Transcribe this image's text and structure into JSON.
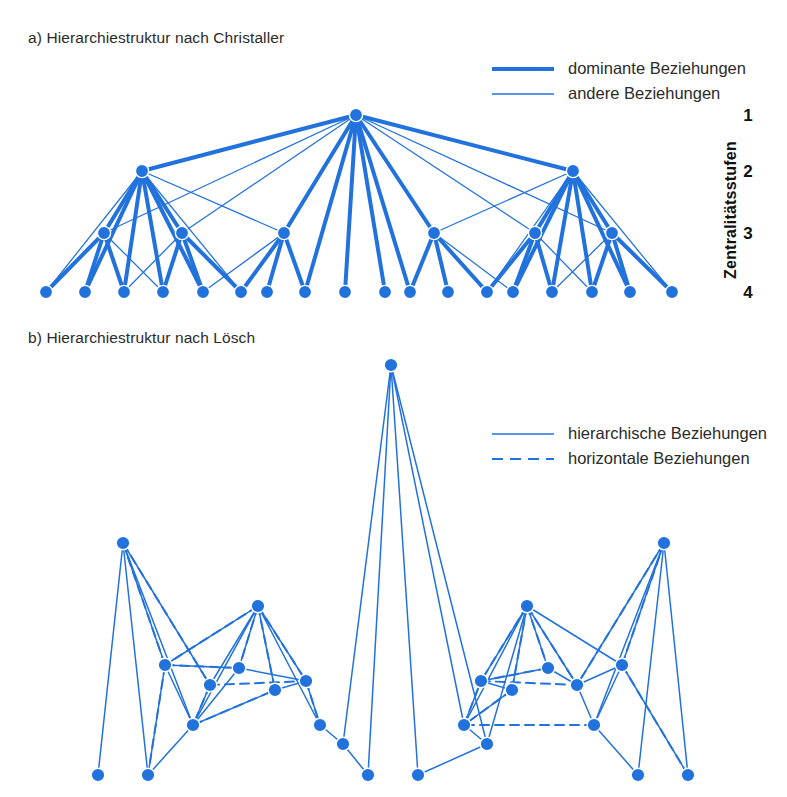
{
  "figure": {
    "accent_color": "#2272dd",
    "text_color": "#2b2b2b",
    "background": "#ffffff"
  },
  "panel_a": {
    "title": "a) Hierarchiestruktur nach Christaller",
    "legend": [
      {
        "label": "dominante Beziehungen",
        "style": "thick-solid",
        "icon": "thick-line-icon"
      },
      {
        "label": "andere Beziehungen",
        "style": "thin-solid",
        "icon": "thin-line-icon"
      }
    ],
    "axis": {
      "label": "Zentralitätsstufen",
      "levels": [
        "1",
        "2",
        "3",
        "4"
      ]
    }
  },
  "panel_b": {
    "title": "b) Hierarchiestruktur nach Lösch",
    "legend": [
      {
        "label": "hierarchische Beziehungen",
        "style": "solid",
        "icon": "solid-line-icon"
      },
      {
        "label": "horizontale Beziehungen",
        "style": "dashed",
        "icon": "dashed-line-icon"
      }
    ]
  },
  "chart_data": {
    "type": "diagram",
    "panels": [
      {
        "id": "a",
        "title": "a) Hierarchiestruktur nach Christaller",
        "type": "hierarchy-tree",
        "levels": [
          {
            "level": 1,
            "y": 115,
            "label": "1"
          },
          {
            "level": 2,
            "y": 171,
            "label": "2"
          },
          {
            "level": 3,
            "y": 233,
            "label": "3"
          },
          {
            "level": 4,
            "y": 292,
            "label": "4"
          }
        ],
        "nodes": [
          {
            "id": "r",
            "level": 1,
            "x": 356,
            "y": 115
          },
          {
            "id": "l2a",
            "level": 2,
            "x": 142,
            "y": 171
          },
          {
            "id": "l2b",
            "level": 2,
            "x": 573,
            "y": 171
          },
          {
            "id": "l3a",
            "level": 3,
            "x": 104,
            "y": 233
          },
          {
            "id": "l3b",
            "level": 3,
            "x": 182,
            "y": 233
          },
          {
            "id": "l3c",
            "level": 3,
            "x": 284,
            "y": 233
          },
          {
            "id": "l3d",
            "level": 3,
            "x": 434,
            "y": 233
          },
          {
            "id": "l3e",
            "level": 3,
            "x": 535,
            "y": 233
          },
          {
            "id": "l3f",
            "level": 3,
            "x": 612,
            "y": 233
          },
          {
            "id": "b1",
            "level": 4,
            "x": 46,
            "y": 292
          },
          {
            "id": "b2",
            "level": 4,
            "x": 85,
            "y": 292
          },
          {
            "id": "b3",
            "level": 4,
            "x": 124,
            "y": 292
          },
          {
            "id": "b4",
            "level": 4,
            "x": 163,
            "y": 292
          },
          {
            "id": "b5",
            "level": 4,
            "x": 203,
            "y": 292
          },
          {
            "id": "b6",
            "level": 4,
            "x": 241,
            "y": 292
          },
          {
            "id": "b7",
            "level": 4,
            "x": 267,
            "y": 292
          },
          {
            "id": "b8",
            "level": 4,
            "x": 305,
            "y": 292
          },
          {
            "id": "b9",
            "level": 4,
            "x": 345,
            "y": 292
          },
          {
            "id": "b10",
            "level": 4,
            "x": 385,
            "y": 292
          },
          {
            "id": "b11",
            "level": 4,
            "x": 410,
            "y": 292
          },
          {
            "id": "b12",
            "level": 4,
            "x": 448,
            "y": 292
          },
          {
            "id": "b13",
            "level": 4,
            "x": 487,
            "y": 292
          },
          {
            "id": "b14",
            "level": 4,
            "x": 513,
            "y": 292
          },
          {
            "id": "b15",
            "level": 4,
            "x": 552,
            "y": 292
          },
          {
            "id": "b16",
            "level": 4,
            "x": 592,
            "y": 292
          },
          {
            "id": "b17",
            "level": 4,
            "x": 630,
            "y": 292
          },
          {
            "id": "b18",
            "level": 4,
            "x": 672,
            "y": 292
          }
        ],
        "edges_dominant": [
          [
            "r",
            "l2a"
          ],
          [
            "r",
            "l2b"
          ],
          [
            "r",
            "l3c"
          ],
          [
            "r",
            "l3d"
          ],
          [
            "r",
            "b8"
          ],
          [
            "r",
            "b9"
          ],
          [
            "r",
            "b10"
          ],
          [
            "r",
            "b11"
          ],
          [
            "l2a",
            "l3a"
          ],
          [
            "l2a",
            "l3b"
          ],
          [
            "l2a",
            "b2"
          ],
          [
            "l2a",
            "b3"
          ],
          [
            "l2a",
            "b4"
          ],
          [
            "l2a",
            "b5"
          ],
          [
            "l2b",
            "l3e"
          ],
          [
            "l2b",
            "l3f"
          ],
          [
            "l2b",
            "b14"
          ],
          [
            "l2b",
            "b15"
          ],
          [
            "l2b",
            "b16"
          ],
          [
            "l2b",
            "b17"
          ],
          [
            "l3a",
            "b1"
          ],
          [
            "l3a",
            "b2"
          ],
          [
            "l3a",
            "b3"
          ],
          [
            "l3b",
            "b4"
          ],
          [
            "l3b",
            "b5"
          ],
          [
            "l3b",
            "b6"
          ],
          [
            "l3c",
            "b6"
          ],
          [
            "l3c",
            "b7"
          ],
          [
            "l3c",
            "b8"
          ],
          [
            "l3d",
            "b11"
          ],
          [
            "l3d",
            "b12"
          ],
          [
            "l3d",
            "b13"
          ],
          [
            "l3e",
            "b13"
          ],
          [
            "l3e",
            "b14"
          ],
          [
            "l3e",
            "b15"
          ],
          [
            "l3f",
            "b16"
          ],
          [
            "l3f",
            "b17"
          ],
          [
            "l3f",
            "b18"
          ]
        ],
        "edges_other": [
          [
            "r",
            "l3a"
          ],
          [
            "r",
            "l3b"
          ],
          [
            "r",
            "l3e"
          ],
          [
            "r",
            "l3f"
          ],
          [
            "l2a",
            "l3c"
          ],
          [
            "l2a",
            "b1"
          ],
          [
            "l2a",
            "b6"
          ],
          [
            "l2b",
            "l3d"
          ],
          [
            "l2b",
            "b13"
          ],
          [
            "l2b",
            "b18"
          ],
          [
            "l3a",
            "b4"
          ],
          [
            "l3b",
            "b3"
          ],
          [
            "l3c",
            "b5"
          ],
          [
            "l3d",
            "b14"
          ],
          [
            "l3e",
            "b16"
          ],
          [
            "l3f",
            "b15"
          ]
        ]
      },
      {
        "id": "b",
        "title": "b) Hierarchiestruktur nach Lösch",
        "type": "network",
        "nodes": [
          {
            "id": "p0",
            "x": 391,
            "y": 28
          },
          {
            "id": "pL",
            "x": 123,
            "y": 206
          },
          {
            "id": "pR",
            "x": 664,
            "y": 206
          },
          {
            "id": "mL",
            "x": 258,
            "y": 269
          },
          {
            "id": "mR",
            "x": 527,
            "y": 269
          },
          {
            "id": "n1",
            "x": 165,
            "y": 328
          },
          {
            "id": "n2",
            "x": 210,
            "y": 348
          },
          {
            "id": "n3",
            "x": 193,
            "y": 388
          },
          {
            "id": "n4",
            "x": 239,
            "y": 331
          },
          {
            "id": "n5",
            "x": 275,
            "y": 353
          },
          {
            "id": "n6",
            "x": 306,
            "y": 344
          },
          {
            "id": "n7",
            "x": 320,
            "y": 388
          },
          {
            "id": "n8",
            "x": 343,
            "y": 407
          },
          {
            "id": "m1",
            "x": 464,
            "y": 388
          },
          {
            "id": "m2",
            "x": 487,
            "y": 407
          },
          {
            "id": "m3",
            "x": 481,
            "y": 344
          },
          {
            "id": "m4",
            "x": 512,
            "y": 353
          },
          {
            "id": "m5",
            "x": 548,
            "y": 331
          },
          {
            "id": "m6",
            "x": 594,
            "y": 388
          },
          {
            "id": "m7",
            "x": 577,
            "y": 348
          },
          {
            "id": "m8",
            "x": 622,
            "y": 328
          },
          {
            "id": "g1",
            "x": 98,
            "y": 438
          },
          {
            "id": "g2",
            "x": 148,
            "y": 438
          },
          {
            "id": "g3",
            "x": 368,
            "y": 438
          },
          {
            "id": "g4",
            "x": 418,
            "y": 438
          },
          {
            "id": "g5",
            "x": 638,
            "y": 438
          },
          {
            "id": "g6",
            "x": 688,
            "y": 438
          }
        ],
        "edges_hierarchical": [
          [
            "p0",
            "g3"
          ],
          [
            "p0",
            "g4"
          ],
          [
            "p0",
            "n8"
          ],
          [
            "p0",
            "m1"
          ],
          [
            "p0",
            "m2"
          ],
          [
            "pL",
            "g1"
          ],
          [
            "pL",
            "g2"
          ],
          [
            "pL",
            "n3"
          ],
          [
            "pL",
            "n1"
          ],
          [
            "pL",
            "n2"
          ],
          [
            "pR",
            "g5"
          ],
          [
            "pR",
            "g6"
          ],
          [
            "pR",
            "m6"
          ],
          [
            "pR",
            "m8"
          ],
          [
            "pR",
            "m7"
          ],
          [
            "mL",
            "n1"
          ],
          [
            "mL",
            "n2"
          ],
          [
            "mL",
            "n3"
          ],
          [
            "mL",
            "n4"
          ],
          [
            "mL",
            "n5"
          ],
          [
            "mL",
            "n6"
          ],
          [
            "mL",
            "n7"
          ],
          [
            "mR",
            "m3"
          ],
          [
            "mR",
            "m4"
          ],
          [
            "mR",
            "m5"
          ],
          [
            "mR",
            "m1"
          ],
          [
            "mR",
            "m2"
          ],
          [
            "mR",
            "m7"
          ],
          [
            "mR",
            "m8"
          ],
          [
            "n1",
            "n3"
          ],
          [
            "n1",
            "n4"
          ],
          [
            "n2",
            "n3"
          ],
          [
            "n3",
            "n5"
          ],
          [
            "n3",
            "n4"
          ],
          [
            "n4",
            "n6"
          ],
          [
            "n5",
            "n6"
          ],
          [
            "n6",
            "n7"
          ],
          [
            "n7",
            "n8"
          ],
          [
            "n3",
            "g2"
          ],
          [
            "m1",
            "m2"
          ],
          [
            "m3",
            "m1"
          ],
          [
            "m4",
            "m1"
          ],
          [
            "m3",
            "m4"
          ],
          [
            "m5",
            "m3"
          ],
          [
            "m5",
            "m7"
          ],
          [
            "m7",
            "m8"
          ],
          [
            "m6",
            "m8"
          ],
          [
            "m6",
            "m7"
          ],
          [
            "m6",
            "g5"
          ],
          [
            "n8",
            "g3"
          ],
          [
            "m2",
            "g4"
          ],
          [
            "n1",
            "g2"
          ],
          [
            "m8",
            "g6"
          ]
        ],
        "edges_horizontal": [
          [
            "pL",
            "n1"
          ],
          [
            "pL",
            "n2"
          ],
          [
            "pR",
            "m7"
          ],
          [
            "pR",
            "m8"
          ],
          [
            "mL",
            "n1"
          ],
          [
            "mL",
            "n4"
          ],
          [
            "mL",
            "n5"
          ],
          [
            "mL",
            "n6"
          ],
          [
            "mR",
            "m3"
          ],
          [
            "mR",
            "m4"
          ],
          [
            "mR",
            "m5"
          ],
          [
            "mR",
            "m7"
          ],
          [
            "n1",
            "n4"
          ],
          [
            "n2",
            "n6"
          ],
          [
            "n3",
            "n5"
          ],
          [
            "n2",
            "n3"
          ],
          [
            "m3",
            "m7"
          ],
          [
            "m4",
            "m1"
          ],
          [
            "m5",
            "m3"
          ],
          [
            "m1",
            "m3"
          ],
          [
            "n6",
            "n7"
          ],
          [
            "m6",
            "m1"
          ],
          [
            "n1",
            "g2"
          ],
          [
            "m8",
            "g6"
          ]
        ]
      }
    ]
  }
}
